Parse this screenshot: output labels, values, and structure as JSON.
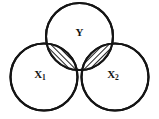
{
  "diagram": {
    "type": "venn-diagram",
    "title": "",
    "background_color": "#ffffff",
    "stroke_color": "#141414",
    "stroke_width": 2.1,
    "hatch_color": "#141414",
    "hatch_fill": "#ffffff",
    "circles": [
      {
        "id": "circle-y",
        "label": "Y",
        "label_sub": "",
        "cx": 79.5,
        "cy": 36.5,
        "r": 33.5,
        "label_x": 79.5,
        "label_y": 33.0
      },
      {
        "id": "circle-x1",
        "label": "X",
        "label_sub": "1",
        "cx": 44.0,
        "cy": 77.0,
        "r": 33.5,
        "label_x": 40.0,
        "label_y": 75.0
      },
      {
        "id": "circle-x2",
        "label": "X",
        "label_sub": "2",
        "cx": 115.0,
        "cy": 77.0,
        "r": 33.5,
        "label_x": 113.0,
        "label_y": 75.0
      }
    ],
    "intersections": [
      {
        "id": "lens-y-x1",
        "between": "Y and X1",
        "shaded": true,
        "hatch_pattern": "diagonal-lines"
      },
      {
        "id": "lens-y-x2",
        "between": "Y and X2",
        "shaded": true,
        "hatch_pattern": "diagonal-lines"
      }
    ]
  }
}
